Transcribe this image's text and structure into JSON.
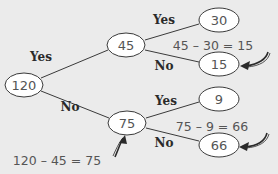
{
  "diagram": {
    "type": "tree",
    "colors": {
      "background": "#ebebeb",
      "node_fill": "#ffffff",
      "node_stroke": "#3a3a3a",
      "node_text": "#555555",
      "label_text": "#2a2a2a"
    },
    "nodes": {
      "root": {
        "value": "120"
      },
      "yes1": {
        "value": "45"
      },
      "no1": {
        "value": "75"
      },
      "yes1_yes": {
        "value": "30"
      },
      "yes1_no": {
        "value": "15"
      },
      "no1_yes": {
        "value": "9"
      },
      "no1_no": {
        "value": "66"
      }
    },
    "edges": {
      "root_yes": {
        "label": "Yes"
      },
      "root_no": {
        "label": "No"
      },
      "yes1_yes": {
        "label": "Yes"
      },
      "yes1_no": {
        "label": "No"
      },
      "no1_yes": {
        "label": "Yes"
      },
      "no1_no": {
        "label": "No"
      }
    },
    "equations": {
      "eq_15": "45 – 30 = 15",
      "eq_66": "75 – 9 = 66",
      "eq_75": "120 – 45 = 75"
    }
  }
}
